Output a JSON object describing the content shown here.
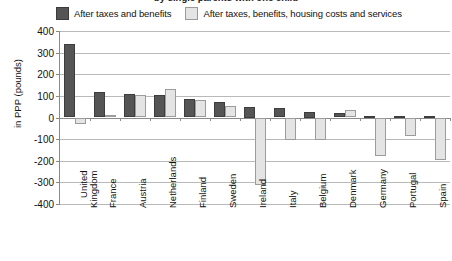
{
  "title": "by single parents with one child",
  "legend": {
    "items": [
      {
        "label": "After taxes and benefits",
        "color": "#555555",
        "key": "dark"
      },
      {
        "label": "After taxes, benefits, housing costs and services",
        "color": "#e4e4e4",
        "key": "light"
      }
    ]
  },
  "chart_data": {
    "type": "bar",
    "title": "by single parents with one child",
    "xlabel": "",
    "ylabel": "in PPP (pounds)",
    "ylim": [
      -400,
      400
    ],
    "yticks": [
      400,
      300,
      200,
      100,
      0,
      -100,
      -200,
      -300,
      -400
    ],
    "ytick_labels": [
      "400",
      "300",
      "200",
      "100",
      "0",
      "-100",
      "-200",
      "-300",
      "-400"
    ],
    "grid": true,
    "legend_position": "top",
    "categories": [
      "United\nKingdom",
      "France",
      "Austria",
      "Netherlands",
      "Finland",
      "Sweden",
      "Ireland",
      "Italy",
      "Belgium",
      "Denmark",
      "Germany",
      "Portugal",
      "Spain"
    ],
    "series": [
      {
        "name": "After taxes and benefits",
        "color": "#555555",
        "values": [
          340,
          120,
          110,
          105,
          85,
          70,
          50,
          45,
          25,
          20,
          8,
          6,
          6
        ]
      },
      {
        "name": "After taxes, benefits, housing costs and services",
        "color": "#e4e4e4",
        "values": [
          -32,
          12,
          105,
          130,
          80,
          55,
          -310,
          -105,
          -105,
          35,
          -180,
          -85,
          -195
        ]
      }
    ]
  }
}
